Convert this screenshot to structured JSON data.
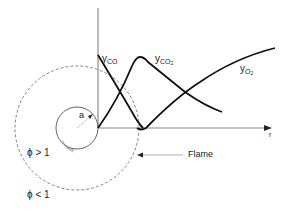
{
  "diagram": {
    "curves": {
      "co": {
        "main": "y",
        "sub": "CO"
      },
      "co2": {
        "main": "y",
        "sub": "CO",
        "sub2": "2"
      },
      "o2": {
        "main": "y",
        "sub": "O",
        "sub2": "2"
      }
    },
    "axis": {
      "x_label": "r"
    },
    "particle": {
      "radius_label": "a"
    },
    "flame": {
      "label": "Flame"
    },
    "regions": {
      "inner": {
        "symbol": "ϕ",
        "relation": "> 1"
      },
      "outer": {
        "symbol": "ϕ",
        "relation": "< 1"
      }
    },
    "colors": {
      "ink": "#1a1a1a",
      "dashed": "#777777",
      "axis": "#555555",
      "background": "#ffffff"
    }
  }
}
